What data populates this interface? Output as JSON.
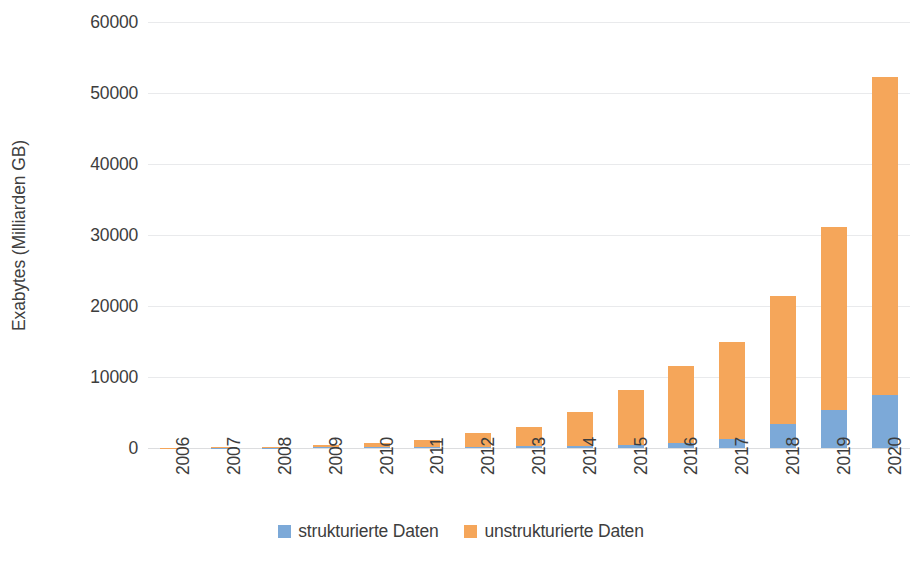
{
  "chart_data": {
    "type": "bar",
    "subtype": "stacked-vertical",
    "title": "",
    "subtitle": "",
    "xlabel": "",
    "ylabel": "Exabytes (Milliarden GB)",
    "categories": [
      "2006",
      "2007",
      "2008",
      "2009",
      "2010",
      "2011",
      "2012",
      "2013",
      "2014",
      "2015",
      "2016",
      "2017",
      "2018",
      "2019",
      "2020"
    ],
    "series": [
      {
        "name": "strukturierte Daten",
        "color": "#7CA9D8",
        "values": [
          10,
          30,
          60,
          90,
          120,
          150,
          180,
          220,
          280,
          450,
          700,
          1200,
          3400,
          5400,
          7400
        ]
      },
      {
        "name": "unstrukturierte Daten",
        "color": "#F5A65A",
        "values": [
          20,
          60,
          140,
          360,
          630,
          950,
          1900,
          2800,
          4800,
          7750,
          10800,
          13800,
          18000,
          25800,
          44800
        ]
      }
    ],
    "totals": [
      30,
      90,
      200,
      450,
      750,
      1100,
      2080,
      3020,
      5080,
      8200,
      11500,
      15000,
      21400,
      31200,
      52200
    ],
    "ylim": [
      0,
      60000
    ],
    "ytick_values": [
      60000,
      50000,
      40000,
      30000,
      20000,
      10000,
      0
    ],
    "ytick_labels": [
      "60000",
      "50000",
      "40000",
      "30000",
      "20000",
      "10000",
      "0"
    ],
    "grid": true,
    "grid_axis": "y",
    "legend_position": "bottom",
    "legend_entries": [
      "strukturierte Daten",
      "unstrukturierte Daten"
    ]
  },
  "axes": {
    "y_title": "Exabytes (Milliarden GB)"
  },
  "legend": {
    "items": [
      {
        "label": "strukturierte Daten",
        "color": "#7CA9D8",
        "swatch_name": "legend-swatch-structured"
      },
      {
        "label": "unstrukturierte Daten",
        "color": "#F5A65A",
        "swatch_name": "legend-swatch-unstructured"
      }
    ]
  },
  "colors": {
    "structured": "#7CA9D8",
    "unstructured": "#F5A65A",
    "gridline": "#E9EAEC",
    "text": "#3D3D3D",
    "background": "#FFFFFF"
  }
}
